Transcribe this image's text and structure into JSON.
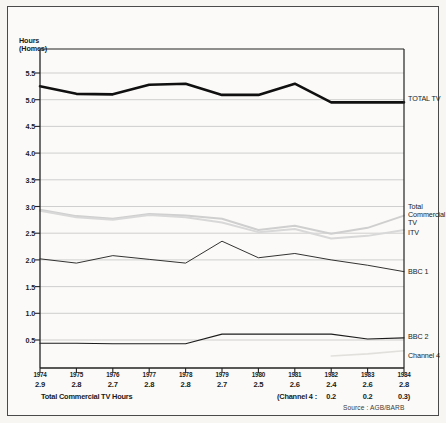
{
  "figure": {
    "y_axis_title": "Hours\n(Homes)",
    "source_note": "Source : AGB/BARB",
    "footnote_total": "Total Commercial TV Hours",
    "footnote_channel4": "(Channel 4 :"
  },
  "chart_data": {
    "type": "line",
    "title": "",
    "xlabel": "",
    "ylabel": "Hours (Homes)",
    "ylim": [
      0.0,
      5.75
    ],
    "yticks": [
      "0.5",
      "1.0",
      "1.5",
      "2.0",
      "2.5",
      "3.0",
      "3.5",
      "4.0",
      "4.5",
      "5.0",
      "5.5"
    ],
    "ytick_values": [
      0.5,
      1.0,
      1.5,
      2.0,
      2.5,
      3.0,
      3.5,
      4.0,
      4.5,
      5.0,
      5.5
    ],
    "grid": true,
    "legend_position": "right-of-axis",
    "categories": [
      "1974",
      "1975",
      "1976",
      "1977",
      "1978",
      "1979",
      "1980",
      "1981",
      "1982",
      "1983",
      "1984"
    ],
    "x": [
      1974,
      1975,
      1976,
      1977,
      1978,
      1979,
      1980,
      1981,
      1982,
      1983,
      1984
    ],
    "series": [
      {
        "name": "TOTAL TV",
        "color": "#101010",
        "width": 2.6,
        "values": [
          5.25,
          5.11,
          5.1,
          5.28,
          5.3,
          5.09,
          5.09,
          5.3,
          4.95,
          4.95,
          4.95
        ]
      },
      {
        "name": "Total Commercial TV",
        "color": "#cfcfcf",
        "width": 2.0,
        "values": [
          2.94,
          2.82,
          2.77,
          2.86,
          2.83,
          2.77,
          2.56,
          2.64,
          2.49,
          2.6,
          2.83
        ]
      },
      {
        "name": "ITV",
        "color": "#d8d8d8",
        "width": 2.0,
        "values": [
          2.92,
          2.8,
          2.75,
          2.84,
          2.8,
          2.7,
          2.52,
          2.58,
          2.4,
          2.45,
          2.56
        ]
      },
      {
        "name": "BBC 1",
        "color": "#1c1c1c",
        "width": 0.9,
        "values": [
          2.02,
          1.94,
          2.08,
          2.01,
          1.94,
          2.35,
          2.04,
          2.12,
          2.0,
          1.9,
          1.78
        ]
      },
      {
        "name": "BBC 2",
        "color": "#1c1c1c",
        "width": 1.1,
        "values": [
          0.44,
          0.44,
          0.43,
          0.43,
          0.43,
          0.61,
          0.61,
          0.61,
          0.61,
          0.52,
          0.54
        ]
      },
      {
        "name": "Channel 4",
        "color": "#e2e0dc",
        "width": 1.6,
        "values": [
          null,
          null,
          null,
          null,
          null,
          null,
          null,
          null,
          0.2,
          0.24,
          0.3
        ]
      }
    ],
    "annotations": {
      "total_commercial_tv_hours": [
        2.9,
        2.8,
        2.7,
        2.8,
        2.8,
        2.7,
        2.5,
        2.6,
        2.4,
        2.6,
        2.8
      ],
      "channel_4_hours": {
        "1982": "0.2",
        "1983": "0.2",
        "1984": "0.3)"
      }
    },
    "series_labels": [
      {
        "key": "total-tv",
        "text": "TOTAL TV"
      },
      {
        "key": "total-commercial-tv",
        "text": "Total\nCommercial\nTV"
      },
      {
        "key": "itv",
        "text": "ITV"
      },
      {
        "key": "bbc1",
        "text": "BBC 1"
      },
      {
        "key": "bbc2",
        "text": "BBC 2"
      },
      {
        "key": "channel4",
        "text": "Channel 4"
      }
    ]
  }
}
